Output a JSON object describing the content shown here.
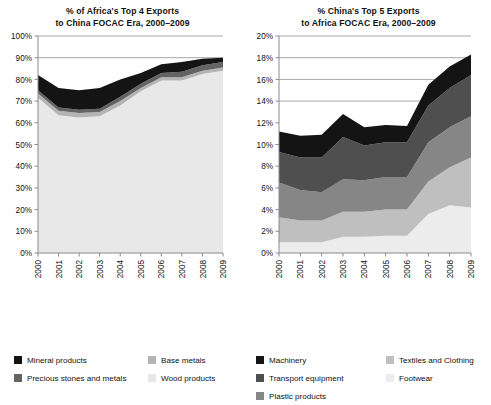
{
  "figure": {
    "width": 491,
    "height": 357,
    "background": "#ffffff"
  },
  "palette": {
    "mineral_products": "#141414",
    "precious_stones_and_metals": "#636363",
    "base_metals": "#b4b4b4",
    "wood_products": "#e8e8e8",
    "machinery": "#141414",
    "transport_equipment": "#4f4f4f",
    "plastic_products": "#868686",
    "textiles_and_clothing": "#bfbfbf",
    "footwear": "#ececec",
    "axis": "#8c8c8c",
    "gridline": "#6f6f6f",
    "text": "#111111"
  },
  "left_panel": {
    "title_line1": "% of Africa's Top 4 Exports",
    "title_line2": "to China FOCAC Era, 2000–2009",
    "legend": {
      "column1": [
        {
          "label": "Mineral products",
          "color_key": "mineral_products"
        },
        {
          "label": "Precious stones and metals",
          "color_key": "precious_stones_and_metals"
        }
      ],
      "column2": [
        {
          "label": "Base metals",
          "color_key": "base_metals"
        },
        {
          "label": "Wood products",
          "color_key": "wood_products"
        }
      ]
    }
  },
  "right_panel": {
    "title_line1": "% China's Top 5 Exports",
    "title_line2": "to Africa FOCAC Era, 2000–2009",
    "legend": {
      "column1": [
        {
          "label": "Machinery",
          "color_key": "machinery"
        },
        {
          "label": "Transport equipment",
          "color_key": "transport_equipment"
        },
        {
          "label": "Plastic products",
          "color_key": "plastic_products"
        }
      ],
      "column2": [
        {
          "label": "Textiles and Clothing",
          "color_key": "textiles_and_clothing"
        },
        {
          "label": "Footwear",
          "color_key": "footwear"
        }
      ]
    }
  },
  "chart_data": [
    {
      "id": "africa-top4-exports-to-china",
      "type": "area",
      "stacked": true,
      "title": "% of Africa's Top 4 Exports to China FOCAC Era, 2000–2009",
      "xlabel": "",
      "ylabel": "",
      "x": [
        2000,
        2001,
        2002,
        2003,
        2004,
        2005,
        2006,
        2007,
        2008,
        2009
      ],
      "categories": [
        "2000",
        "2001",
        "2002",
        "2003",
        "2004",
        "2005",
        "2006",
        "2007",
        "2008",
        "2009"
      ],
      "xtick_labels": [
        "2000",
        "2001",
        "2002",
        "2003",
        "2004",
        "2005",
        "2006",
        "2007",
        "2008",
        "2009"
      ],
      "xtick_rotation": 90,
      "ylim": [
        0,
        100
      ],
      "ytick_labels": [
        "0%",
        "10%",
        "20%",
        "30%",
        "40%",
        "50%",
        "60%",
        "70%",
        "80%",
        "90%",
        "100%"
      ],
      "ytick_values": [
        0,
        10,
        20,
        30,
        40,
        50,
        60,
        70,
        80,
        90,
        100
      ],
      "gridlines": [
        90,
        100
      ],
      "grid": true,
      "legend_position": "bottom",
      "series": [
        {
          "name": "Wood products",
          "color_key": "wood_products",
          "order": 1,
          "values": [
            71.5,
            63.5,
            62.5,
            63.0,
            68.0,
            74.5,
            79.5,
            79.5,
            82.5,
            84.0
          ]
        },
        {
          "name": "Base metals",
          "color_key": "base_metals",
          "order": 2,
          "values": [
            2.0,
            2.0,
            2.0,
            2.0,
            2.0,
            1.5,
            1.5,
            1.5,
            1.5,
            1.5
          ]
        },
        {
          "name": "Precious stones and metals",
          "color_key": "precious_stones_and_metals",
          "order": 3,
          "values": [
            1.5,
            1.5,
            1.5,
            1.5,
            2.0,
            2.0,
            2.0,
            2.5,
            2.5,
            2.5
          ]
        },
        {
          "name": "Mineral products",
          "color_key": "mineral_products",
          "order": 4,
          "values": [
            7.0,
            9.0,
            9.0,
            9.5,
            8.0,
            5.0,
            4.0,
            4.5,
            3.0,
            2.0
          ]
        }
      ],
      "series_totals": [
        82.0,
        76.0,
        75.0,
        76.0,
        80.0,
        83.0,
        87.0,
        88.0,
        89.5,
        90.0
      ]
    },
    {
      "id": "china-top5-exports-to-africa",
      "type": "area",
      "stacked": true,
      "title": "% China's Top 5 Exports to Africa FOCAC Era, 2000–2009",
      "xlabel": "",
      "ylabel": "",
      "x": [
        2000,
        2001,
        2002,
        2003,
        2004,
        2005,
        2006,
        2007,
        2008,
        2009
      ],
      "categories": [
        "2000",
        "2001",
        "2002",
        "2003",
        "2004",
        "2005",
        "2006",
        "2007",
        "2008",
        "2009"
      ],
      "xtick_labels": [
        "2000",
        "2001",
        "2002",
        "2003",
        "2004",
        "2005",
        "2006",
        "2007",
        "2008",
        "2009"
      ],
      "xtick_rotation": 90,
      "ylim": [
        0,
        20
      ],
      "ytick_labels": [
        "0%",
        "2%",
        "4%",
        "6%",
        "8%",
        "10%",
        "12%",
        "14%",
        "16%",
        "18%",
        "20%"
      ],
      "ytick_values": [
        0,
        2,
        4,
        6,
        8,
        10,
        12,
        14,
        16,
        18,
        20
      ],
      "gridlines": [
        14,
        16,
        18,
        20
      ],
      "grid": true,
      "legend_position": "bottom",
      "series": [
        {
          "name": "Footwear",
          "color_key": "footwear",
          "order": 1,
          "values": [
            1.0,
            1.0,
            1.0,
            1.5,
            1.5,
            1.6,
            1.6,
            3.6,
            4.4,
            4.2
          ]
        },
        {
          "name": "Textiles and Clothing",
          "color_key": "textiles_and_clothing",
          "order": 2,
          "values": [
            2.3,
            2.0,
            2.0,
            2.3,
            2.3,
            2.4,
            2.4,
            3.0,
            3.5,
            4.6
          ]
        },
        {
          "name": "Plastic products",
          "color_key": "plastic_products",
          "order": 3,
          "values": [
            3.2,
            2.8,
            2.6,
            3.0,
            2.9,
            3.0,
            3.0,
            3.6,
            3.7,
            3.8
          ]
        },
        {
          "name": "Transport equipment",
          "color_key": "transport_equipment",
          "order": 4,
          "values": [
            2.8,
            3.0,
            3.2,
            3.9,
            3.2,
            3.2,
            3.2,
            3.4,
            3.6,
            3.8
          ]
        },
        {
          "name": "Machinery",
          "color_key": "machinery",
          "order": 5,
          "values": [
            1.9,
            2.0,
            2.1,
            2.1,
            1.7,
            1.6,
            1.5,
            1.9,
            2.0,
            1.9
          ]
        }
      ],
      "series_totals": [
        11.2,
        10.8,
        10.9,
        12.8,
        11.6,
        11.8,
        11.7,
        15.5,
        17.2,
        18.3
      ]
    }
  ]
}
